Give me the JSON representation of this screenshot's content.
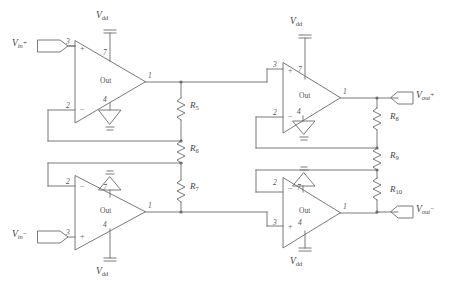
{
  "diagram": {
    "stroke_color": "#6b6b6b",
    "text_color": "#3f3f3f",
    "background": "#ffffff"
  },
  "ports": [
    {
      "id": "vin_p",
      "label_v": "V",
      "label_sub": "in",
      "label_sup": "+",
      "text": "Vin+",
      "x": 14,
      "y": 43
    },
    {
      "id": "vin_n",
      "label_v": "V",
      "label_sub": "in",
      "label_sup": "−",
      "text": "Vin-",
      "x": 14,
      "y": 238
    },
    {
      "id": "vout_p",
      "label_v": "V",
      "label_sub": "out",
      "label_sup": "+",
      "text": "Vout+",
      "x": 414,
      "y": 80
    },
    {
      "id": "vout_n",
      "label_v": "V",
      "label_sub": "out",
      "label_sup": "−",
      "text": "Vout-",
      "x": 414,
      "y": 209
    }
  ],
  "supplies": [
    {
      "id": "vdd-top-left",
      "text": "Vdd",
      "v": "V",
      "sub": "dd",
      "x": 101,
      "y": 12
    },
    {
      "id": "vdd-top-right",
      "text": "Vdd",
      "v": "V",
      "sub": "dd",
      "x": 295,
      "y": 20
    },
    {
      "id": "vdd-bottom-left",
      "text": "Vdd",
      "v": "V",
      "sub": "dd",
      "x": 101,
      "y": 268
    },
    {
      "id": "vdd-bottom-right",
      "text": "Vdd",
      "v": "V",
      "sub": "dd",
      "x": 295,
      "y": 258
    }
  ],
  "opamps": [
    {
      "id": "opamp-top-left",
      "out_text": "Out",
      "pin_plus": "3",
      "pin_minus": "2",
      "pin_out": "1",
      "pin_vdd": "7",
      "pin_gnd": "4",
      "plus_position": "top",
      "orientation": "normal"
    },
    {
      "id": "opamp-top-right",
      "out_text": "Out",
      "pin_plus": "3",
      "pin_minus": "2",
      "pin_out": "1",
      "pin_vdd": "7",
      "pin_gnd": "4",
      "plus_position": "top",
      "orientation": "normal"
    },
    {
      "id": "opamp-bottom-left",
      "out_text": "Out",
      "pin_plus": "3",
      "pin_minus": "2",
      "pin_out": "1",
      "pin_vdd": "4",
      "pin_gnd": "7",
      "plus_position": "bottom",
      "orientation": "flipped"
    },
    {
      "id": "opamp-bottom-right",
      "out_text": "Out",
      "pin_plus": "3",
      "pin_minus": "2",
      "pin_out": "1",
      "pin_vdd": "4",
      "pin_gnd": "7",
      "plus_position": "bottom",
      "orientation": "flipped"
    }
  ],
  "resistors": [
    {
      "id": "R5",
      "name": "R",
      "sub": "5",
      "text": "R5",
      "label_x": 190,
      "label_y": 100,
      "chain": "center"
    },
    {
      "id": "R6",
      "name": "R",
      "sub": "6",
      "text": "R6",
      "label_x": 190,
      "label_y": 141,
      "chain": "center"
    },
    {
      "id": "R7",
      "name": "R",
      "sub": "7",
      "text": "R7",
      "label_x": 190,
      "label_y": 180,
      "chain": "center"
    },
    {
      "id": "R8",
      "name": "R",
      "sub": "8",
      "text": "R8",
      "label_x": 396,
      "label_y": 110,
      "chain": "right"
    },
    {
      "id": "R9",
      "name": "R",
      "sub": "9",
      "text": "R9",
      "label_x": 396,
      "label_y": 148,
      "chain": "right"
    },
    {
      "id": "R10",
      "name": "R",
      "sub": "10",
      "text": "R10",
      "label_x": 396,
      "label_y": 183,
      "chain": "right"
    }
  ],
  "pin_numbers": {
    "three": "3",
    "two": "2",
    "one": "1",
    "seven": "7",
    "four": "4"
  },
  "signs": {
    "plus": "+",
    "minus": "−"
  }
}
